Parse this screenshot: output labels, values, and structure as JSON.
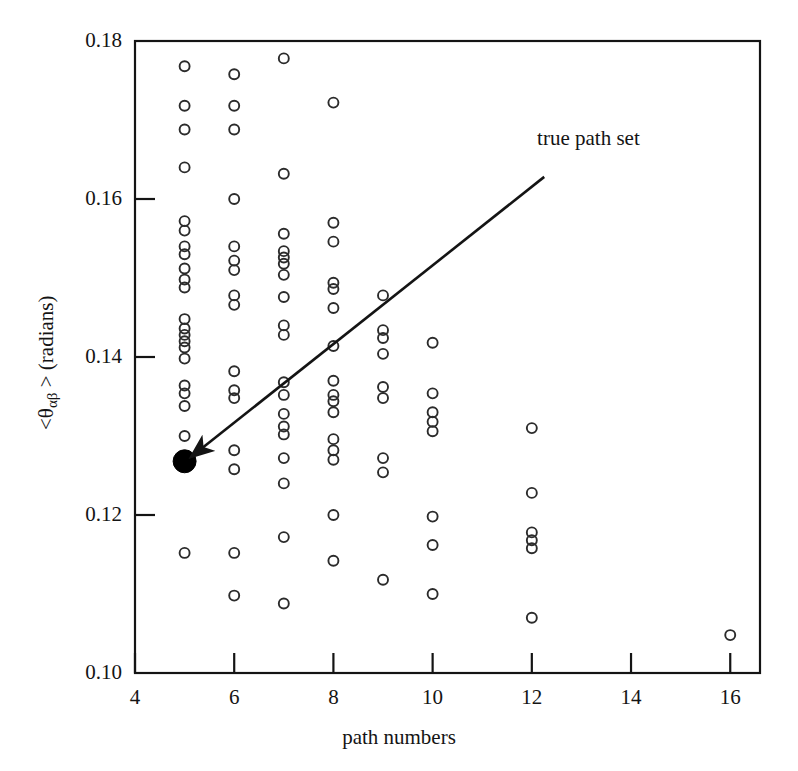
{
  "chart_data": {
    "type": "scatter",
    "title": "",
    "xlabel": "path numbers",
    "ylabel": "<θαβ > (radians)",
    "ylabel_parts": {
      "pre": "<θ",
      "sub": "αβ",
      "post": " > (radians)"
    },
    "xlim": [
      4,
      16.6
    ],
    "ylim": [
      0.1,
      0.18
    ],
    "xticks": [
      4,
      6,
      8,
      10,
      12,
      14,
      16
    ],
    "xticklabels": [
      "4",
      "6",
      "8",
      "10",
      "12",
      "14",
      "16"
    ],
    "yticks": [
      0.1,
      0.12,
      0.14,
      0.16,
      0.18
    ],
    "yticklabels": [
      "0.10",
      "0.12",
      "0.14",
      "0.16",
      "0.18"
    ],
    "grid": false,
    "legend": "none",
    "marker_open": "open-circle",
    "marker_highlight": "filled-circle",
    "annotations": [
      {
        "text": "true path set",
        "text_x": 12.55,
        "text_y": 0.1675,
        "arrow_from_x": 12.25,
        "arrow_from_y": 0.1628,
        "arrow_to_x": 5.12,
        "arrow_to_y": 0.1273
      }
    ],
    "series": [
      {
        "name": "candidate path sets",
        "marker": "open-circle",
        "points": [
          [
            5,
            0.1768
          ],
          [
            5,
            0.1718
          ],
          [
            5,
            0.1688
          ],
          [
            5,
            0.164
          ],
          [
            5,
            0.1572
          ],
          [
            5,
            0.156
          ],
          [
            5,
            0.154
          ],
          [
            5,
            0.153
          ],
          [
            5,
            0.1512
          ],
          [
            5,
            0.1498
          ],
          [
            5,
            0.1488
          ],
          [
            5,
            0.1448
          ],
          [
            5,
            0.1436
          ],
          [
            5,
            0.1428
          ],
          [
            5,
            0.142
          ],
          [
            5,
            0.1412
          ],
          [
            5,
            0.1398
          ],
          [
            5,
            0.1364
          ],
          [
            5,
            0.1354
          ],
          [
            5,
            0.1338
          ],
          [
            5,
            0.13
          ],
          [
            5,
            0.1152
          ]
        ]
      },
      {
        "name": "candidate path sets x6",
        "marker": "open-circle",
        "points": [
          [
            6,
            0.1758
          ],
          [
            6,
            0.1718
          ],
          [
            6,
            0.1688
          ],
          [
            6,
            0.16
          ],
          [
            6,
            0.154
          ],
          [
            6,
            0.1522
          ],
          [
            6,
            0.151
          ],
          [
            6,
            0.1478
          ],
          [
            6,
            0.1466
          ],
          [
            6,
            0.1382
          ],
          [
            6,
            0.1358
          ],
          [
            6,
            0.1348
          ],
          [
            6,
            0.1282
          ],
          [
            6,
            0.1258
          ],
          [
            6,
            0.1152
          ],
          [
            6,
            0.1098
          ]
        ]
      },
      {
        "name": "candidate path sets x7",
        "marker": "open-circle",
        "points": [
          [
            7,
            0.1778
          ],
          [
            7,
            0.1632
          ],
          [
            7,
            0.1556
          ],
          [
            7,
            0.1534
          ],
          [
            7,
            0.1526
          ],
          [
            7,
            0.1518
          ],
          [
            7,
            0.1504
          ],
          [
            7,
            0.1476
          ],
          [
            7,
            0.144
          ],
          [
            7,
            0.1428
          ],
          [
            7,
            0.1368
          ],
          [
            7,
            0.1352
          ],
          [
            7,
            0.1328
          ],
          [
            7,
            0.1312
          ],
          [
            7,
            0.1302
          ],
          [
            7,
            0.1272
          ],
          [
            7,
            0.124
          ],
          [
            7,
            0.1172
          ],
          [
            7,
            0.1088
          ]
        ]
      },
      {
        "name": "candidate path sets x8",
        "marker": "open-circle",
        "points": [
          [
            8,
            0.1722
          ],
          [
            8,
            0.157
          ],
          [
            8,
            0.1546
          ],
          [
            8,
            0.1494
          ],
          [
            8,
            0.1486
          ],
          [
            8,
            0.1462
          ],
          [
            8,
            0.1414
          ],
          [
            8,
            0.137
          ],
          [
            8,
            0.1352
          ],
          [
            8,
            0.1344
          ],
          [
            8,
            0.133
          ],
          [
            8,
            0.1296
          ],
          [
            8,
            0.1282
          ],
          [
            8,
            0.127
          ],
          [
            8,
            0.12
          ],
          [
            8,
            0.1142
          ]
        ]
      },
      {
        "name": "candidate path sets x9",
        "marker": "open-circle",
        "points": [
          [
            9,
            0.1478
          ],
          [
            9,
            0.1434
          ],
          [
            9,
            0.1424
          ],
          [
            9,
            0.1404
          ],
          [
            9,
            0.1362
          ],
          [
            9,
            0.1348
          ],
          [
            9,
            0.1272
          ],
          [
            9,
            0.1254
          ],
          [
            9,
            0.1118
          ]
        ]
      },
      {
        "name": "candidate path sets x10",
        "marker": "open-circle",
        "points": [
          [
            10,
            0.1418
          ],
          [
            10,
            0.1354
          ],
          [
            10,
            0.133
          ],
          [
            10,
            0.1318
          ],
          [
            10,
            0.1306
          ],
          [
            10,
            0.1198
          ],
          [
            10,
            0.1162
          ],
          [
            10,
            0.11
          ]
        ]
      },
      {
        "name": "candidate path sets x12",
        "marker": "open-circle",
        "points": [
          [
            12,
            0.131
          ],
          [
            12,
            0.1228
          ],
          [
            12,
            0.1178
          ],
          [
            12,
            0.1168
          ],
          [
            12,
            0.1158
          ],
          [
            12,
            0.107
          ]
        ]
      },
      {
        "name": "candidate path sets x16",
        "marker": "open-circle",
        "points": [
          [
            16,
            0.1048
          ]
        ]
      },
      {
        "name": "true path set",
        "marker": "filled-circle",
        "points": [
          [
            5,
            0.1268
          ]
        ]
      }
    ]
  },
  "axes": {
    "x_label": "path numbers",
    "y_label_pre": "<θ",
    "y_label_sub": "αβ",
    "y_label_post": " > (radians)",
    "x_tick_labels": [
      "4",
      "6",
      "8",
      "10",
      "12",
      "14",
      "16"
    ],
    "y_tick_labels": [
      "0.18",
      "0.16",
      "0.14",
      "0.12",
      "0.10"
    ]
  },
  "annotation": {
    "label": "true path set"
  },
  "colors": {
    "ink": "#141414",
    "background": "#ffffff",
    "marker_stroke": "#2b2b2b",
    "marker_fill": "#000000"
  }
}
